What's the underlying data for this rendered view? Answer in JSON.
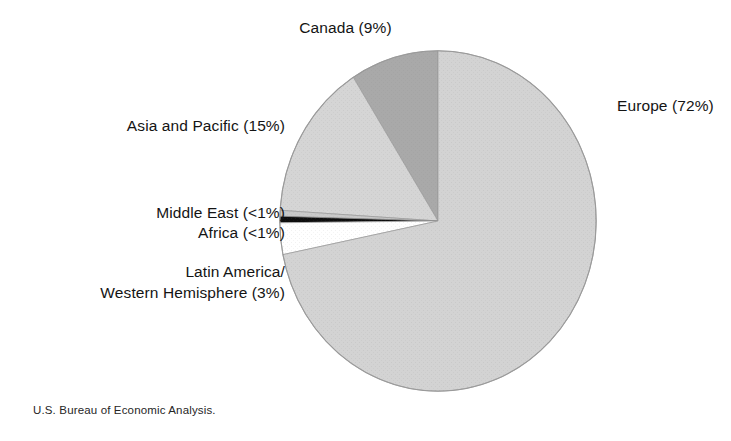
{
  "chart_data": {
    "type": "pie",
    "title": "",
    "subtitle": "",
    "xlabel": "",
    "ylabel": "",
    "legend_position": "callout-labels",
    "grid": false,
    "start_angle_deg": 90,
    "direction": "counterclockwise",
    "categories": [
      "Canada",
      "Asia and Pacific",
      "Middle East",
      "Africa",
      "Latin America/Western Hemisphere",
      "Europe"
    ],
    "values": [
      9,
      15,
      0.5,
      0.5,
      3,
      72
    ],
    "value_labels": [
      "9%",
      "15%",
      "<1%",
      "<1%",
      "3%",
      "72%"
    ],
    "slices": [
      {
        "name": "Canada",
        "value": 9,
        "value_label": "9%",
        "label": "Canada (9%)",
        "color": "#a9a9a9",
        "start_deg": 90,
        "sweep_deg": 32.4
      },
      {
        "name": "Asia and Pacific",
        "value": 15,
        "value_label": "15%",
        "label": "Asia and Pacific (15%)",
        "color": "#d5d5d5",
        "start_deg": 122.4,
        "sweep_deg": 54.0
      },
      {
        "name": "Middle East",
        "value": 0.5,
        "value_label": "<1%",
        "label": "Middle East (<1%)",
        "color": "#c9c9c9",
        "start_deg": 176.4,
        "sweep_deg": 2.0
      },
      {
        "name": "Africa",
        "value": 0.5,
        "value_label": "<1%",
        "label": "Africa (<1%)",
        "color": "#0d0d0d",
        "start_deg": 178.4,
        "sweep_deg": 2.2
      },
      {
        "name": "Latin America/Western Hemisphere",
        "value": 3,
        "value_label": "3%",
        "label": "Latin America/ Western Hemisphere (3%)",
        "color": "#ffffff",
        "start_deg": 180.6,
        "sweep_deg": 10.8
      },
      {
        "name": "Europe",
        "value": 72,
        "value_label": "72%",
        "label": "Europe (72%)",
        "color": "#d3d3d3",
        "start_deg": 191.4,
        "sweep_deg": 258.6
      }
    ],
    "outline_color": "#9a9a9a"
  },
  "labels": {
    "canada": "Canada (9%)",
    "europe": "Europe (72%)",
    "asia_pacific": "Asia and Pacific (15%)",
    "middle_east": "Middle East (<1%)",
    "africa": "Africa (<1%)",
    "latin_america_line1": "Latin America/",
    "latin_america_line2": "Western Hemisphere (3%)"
  },
  "source": {
    "note": "U.S. Bureau of Economic Analysis."
  },
  "colors": {
    "background": "#ffffff",
    "text": "#141414",
    "canada_slice": "#a9a9a9",
    "europe_slice": "#d3d3d3",
    "asia_slice": "#d5d5d5",
    "middle_east_slice": "#c9c9c9",
    "africa_slice": "#0d0d0d",
    "latin_america_slice": "#ffffff",
    "pie_outline": "#9a9a9a"
  }
}
